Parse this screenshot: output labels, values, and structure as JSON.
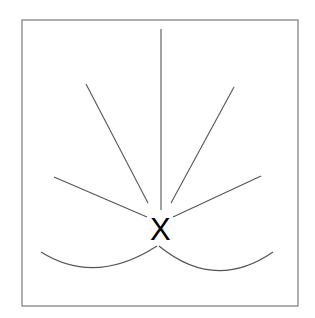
{
  "diagram": {
    "center_label": "X",
    "frame": {
      "x": 22,
      "y": 20,
      "width": 276,
      "height": 286,
      "stroke": "#7a7a7a"
    },
    "rays": [
      {
        "name": "ray-vertical",
        "x1": 161,
        "y1": 29,
        "x2": 161,
        "y2": 210
      },
      {
        "name": "ray-upper-left",
        "x1": 86,
        "y1": 84,
        "x2": 148,
        "y2": 203
      },
      {
        "name": "ray-upper-right",
        "x1": 234,
        "y1": 87,
        "x2": 171,
        "y2": 203
      },
      {
        "name": "ray-lower-left",
        "x1": 54,
        "y1": 177,
        "x2": 147,
        "y2": 217
      },
      {
        "name": "ray-lower-right",
        "x1": 261,
        "y1": 176,
        "x2": 173,
        "y2": 217
      }
    ],
    "curves": [
      {
        "name": "curve-left",
        "d": "M41,252 Q95,286 157,246"
      },
      {
        "name": "curve-right",
        "d": "M159,246 Q215,292 273,252"
      }
    ],
    "line_color": "#555555",
    "label_color": "#000000"
  }
}
